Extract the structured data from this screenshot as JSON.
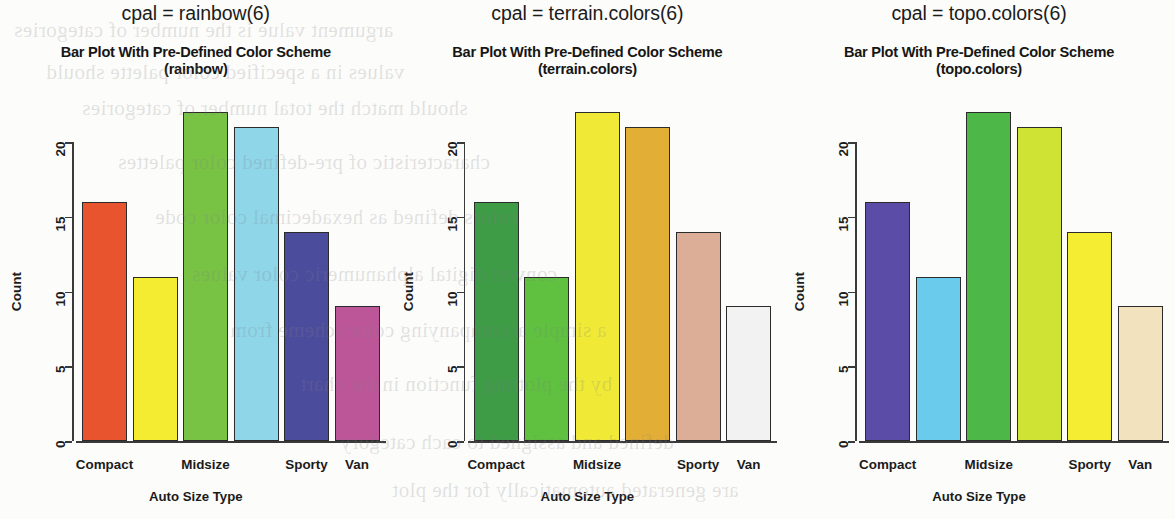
{
  "panels": [
    {
      "cpal_caption": "cpal = rainbow(6)",
      "title_line1": "Bar Plot With Pre-Defined Color Scheme",
      "title_line2": "(rainbow)",
      "chart_data": {
        "type": "bar",
        "title": "Bar Plot With Pre-Defined Color Scheme (rainbow)",
        "xlabel": "Auto Size Type",
        "ylabel": "Count",
        "categories": [
          "Compact",
          "",
          "Midsize",
          "",
          "Sporty",
          "Van"
        ],
        "tick_labels": [
          "Compact",
          "Midsize",
          "Sporty",
          "Van"
        ],
        "values": [
          16,
          11,
          22,
          21,
          14,
          9
        ],
        "colors": [
          "#E8542E",
          "#F3EC30",
          "#79C344",
          "#8FD6E9",
          "#4C4C9D",
          "#BD5698"
        ],
        "ylim": [
          0,
          22
        ],
        "yticks": [
          0,
          5,
          10,
          15,
          20
        ],
        "ytick_labels": [
          "0",
          "5",
          "10",
          "15",
          "20"
        ],
        "grid": false,
        "legend": "none"
      }
    },
    {
      "cpal_caption": "cpal = terrain.colors(6)",
      "title_line1": "Bar Plot With Pre-Defined Color Scheme",
      "title_line2": "(terrain.colors)",
      "chart_data": {
        "type": "bar",
        "title": "Bar Plot With Pre-Defined Color Scheme (terrain.colors)",
        "xlabel": "Auto Size Type",
        "ylabel": "Count",
        "categories": [
          "Compact",
          "",
          "Midsize",
          "",
          "Sporty",
          "Van"
        ],
        "tick_labels": [
          "Compact",
          "Midsize",
          "Sporty",
          "Van"
        ],
        "values": [
          16,
          11,
          22,
          21,
          14,
          9
        ],
        "colors": [
          "#3E9B46",
          "#5FC13F",
          "#F0EA36",
          "#E3AE36",
          "#DDAE97",
          "#F2F2F2"
        ],
        "ylim": [
          0,
          22
        ],
        "yticks": [
          0,
          5,
          10,
          15,
          20
        ],
        "ytick_labels": [
          "0",
          "5",
          "10",
          "15",
          "20"
        ],
        "grid": false,
        "legend": "none"
      }
    },
    {
      "cpal_caption": "cpal = topo.colors(6)",
      "title_line1": "Bar Plot With Pre-Defined Color Scheme",
      "title_line2": "(topo.colors)",
      "chart_data": {
        "type": "bar",
        "title": "Bar Plot With Pre-Defined Color Scheme (topo.colors)",
        "xlabel": "Auto Size Type",
        "ylabel": "Count",
        "categories": [
          "Compact",
          "",
          "Midsize",
          "",
          "Sporty",
          "Van"
        ],
        "tick_labels": [
          "Compact",
          "Midsize",
          "Sporty",
          "Van"
        ],
        "values": [
          16,
          11,
          22,
          21,
          14,
          9
        ],
        "colors": [
          "#5B4CA8",
          "#6ACBEC",
          "#4DB848",
          "#CFE334",
          "#F5ED32",
          "#F2E3BE"
        ],
        "ylim": [
          0,
          22
        ],
        "yticks": [
          0,
          5,
          10,
          15,
          20
        ],
        "ytick_labels": [
          "0",
          "5",
          "10",
          "15",
          "20"
        ],
        "grid": false,
        "legend": "none"
      }
    }
  ]
}
